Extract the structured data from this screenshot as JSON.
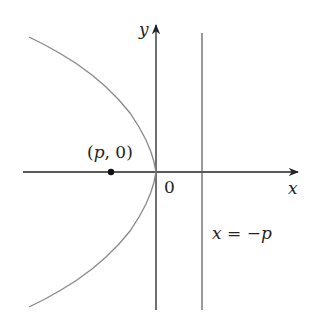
{
  "diagram": {
    "type": "parabola",
    "axes": {
      "x_label": "x",
      "y_label": "y",
      "origin_label": "0"
    },
    "focus_label": "(p, 0)",
    "directrix_label": "x = −p",
    "colors": {
      "axis": "#222222",
      "curve": "#888888",
      "directrix": "#555555",
      "focus": "#111111"
    }
  }
}
